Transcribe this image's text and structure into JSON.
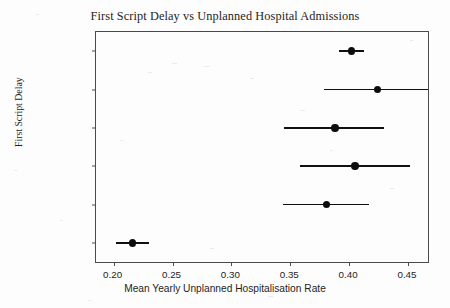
{
  "chart_data": {
    "type": "scatter",
    "title": "First Script Delay vs Unplanned Hospital Admissions",
    "xlabel": "Mean Yearly Unplanned Hospitalisation Rate",
    "ylabel": "First Script Delay",
    "orientation": "horizontal",
    "grid": false,
    "legend": null,
    "xlim": [
      0.185,
      0.467
    ],
    "xticks": [
      0.2,
      0.25,
      0.3,
      0.35,
      0.4,
      0.45
    ],
    "xtick_labels": [
      "0.20",
      "0.25",
      "0.30",
      "0.35",
      "0.40",
      "0.45"
    ],
    "categories": [
      "> 12 Months",
      "6-12 Months",
      "3-6 Months",
      "1-3 Months",
      "0-1 Month",
      "No Delay"
    ],
    "values": [
      0.402,
      0.424,
      0.388,
      0.405,
      0.381,
      0.216
    ],
    "ci_low": [
      0.391,
      0.379,
      0.345,
      0.358,
      0.344,
      0.202
    ],
    "ci_high": [
      0.413,
      0.467,
      0.43,
      0.452,
      0.417,
      0.23
    ],
    "points": [
      {
        "category": "> 12 Months",
        "value": 0.402,
        "ci_low": 0.391,
        "ci_high": 0.413
      },
      {
        "category": "6-12 Months",
        "value": 0.424,
        "ci_low": 0.379,
        "ci_high": 0.467
      },
      {
        "category": "3-6 Months",
        "value": 0.388,
        "ci_low": 0.345,
        "ci_high": 0.43
      },
      {
        "category": "1-3 Months",
        "value": 0.405,
        "ci_low": 0.358,
        "ci_high": 0.452
      },
      {
        "category": "0-1 Month",
        "value": 0.381,
        "ci_low": 0.344,
        "ci_high": 0.417
      },
      {
        "category": "No Delay",
        "value": 0.216,
        "ci_low": 0.202,
        "ci_high": 0.23
      }
    ],
    "marker": "filled-circle",
    "colors": {
      "marker": "#0d0d0d",
      "error_bar": "#111111",
      "axis": "#4a4a4a",
      "text": "#1d1d1d",
      "background": "#fdfdfd"
    }
  }
}
